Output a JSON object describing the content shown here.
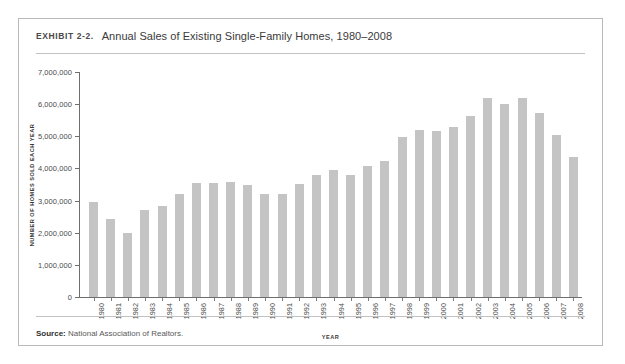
{
  "figure": {
    "exhibit_label": "Exhibit 2-2.",
    "title": "Annual Sales of Existing Single-Family Homes, 1980–2008",
    "source_prefix": "Source:",
    "source_text": "National Association of Realtors.",
    "border_color": "#b9b9b9",
    "rule_color": "#c2c2c2",
    "bar_color": "#c4c4c4",
    "axis_color": "#6e6e6e"
  },
  "chart_data": {
    "type": "bar",
    "title": "Annual Sales of Existing Single-Family Homes, 1980–2008",
    "xlabel": "YEAR",
    "ylabel": "NUMBER OF HOMES SOLD EACH YEAR",
    "ylim": [
      0,
      7000000
    ],
    "ytick_step": 1000000,
    "grid": false,
    "legend": null,
    "ytick_labels": [
      "0",
      "1,000,000",
      "2,000,000",
      "3,000,000",
      "4,000,000",
      "5,000,000",
      "6,000,000",
      "7,000,000"
    ],
    "ytick_values": [
      0,
      1000000,
      2000000,
      3000000,
      4000000,
      5000000,
      6000000,
      7000000
    ],
    "categories": [
      "1980",
      "1981",
      "1982",
      "1983",
      "1984",
      "1985",
      "1986",
      "1987",
      "1988",
      "1989",
      "1990",
      "1991",
      "1992",
      "1993",
      "1994",
      "1995",
      "1996",
      "1997",
      "1998",
      "1999",
      "2000",
      "2001",
      "2002",
      "2003",
      "2004",
      "2005",
      "2006",
      "2007",
      "2008"
    ],
    "values": [
      2970000,
      2420000,
      1990000,
      2700000,
      2830000,
      3210000,
      3560000,
      3540000,
      3590000,
      3470000,
      3220000,
      3220000,
      3520000,
      3800000,
      3950000,
      3810000,
      4090000,
      4220000,
      4970000,
      5200000,
      5170000,
      5300000,
      5630000,
      6180000,
      6010000,
      6180000,
      5710000,
      5030000,
      4370000
    ],
    "peak_year": "2005",
    "peak_value": 6180000,
    "trough_year": "1982",
    "trough_value": 1990000
  }
}
